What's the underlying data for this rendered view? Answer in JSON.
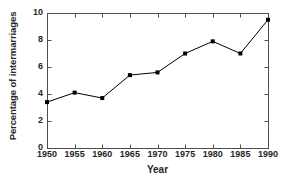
{
  "chart_data": {
    "type": "line",
    "title": "",
    "xlabel": "Year",
    "ylabel": "Percentage of intermarriages",
    "x": [
      1950,
      1955,
      1960,
      1965,
      1970,
      1975,
      1980,
      1985,
      1990
    ],
    "values": [
      3.4,
      4.1,
      3.7,
      5.4,
      5.6,
      7.0,
      7.9,
      7.0,
      9.5
    ],
    "xtick_labels": [
      "1950",
      "1955",
      "1960",
      "1965",
      "1970",
      "1975",
      "1980",
      "1985",
      "1990"
    ],
    "ytick_labels": [
      "0",
      "2",
      "4",
      "6",
      "8",
      "10"
    ],
    "yticks": [
      0,
      2,
      4,
      6,
      8,
      10
    ],
    "xlim": [
      1950,
      1990
    ],
    "ylim": [
      0,
      10
    ],
    "grid": false,
    "legend": null,
    "marker": "square",
    "line_color": "#000000",
    "marker_color": "#000000",
    "background_color": "#ffffff",
    "axis_color": "#4d4d4d"
  }
}
